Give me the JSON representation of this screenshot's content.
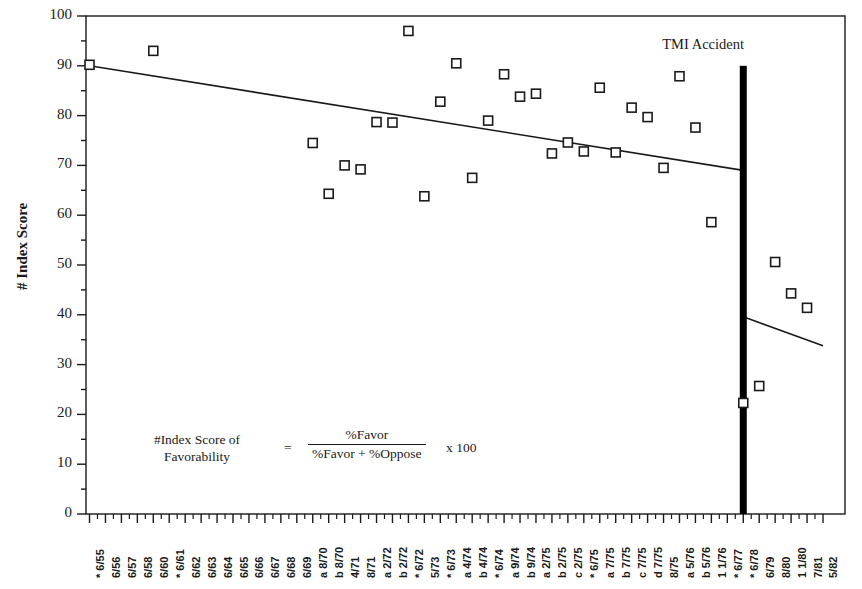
{
  "chart_data": {
    "type": "scatter",
    "title": "",
    "xlabel": "",
    "ylabel": "# Index Score",
    "ylim": [
      0,
      100
    ],
    "ytick_values": [
      0,
      10,
      20,
      30,
      40,
      50,
      60,
      70,
      80,
      90,
      100
    ],
    "ytick_labels": [
      "0",
      "10",
      "20",
      "30",
      "40",
      "50",
      "60",
      "70",
      "80",
      "90",
      "100"
    ],
    "yminor_step": 5,
    "grid": false,
    "legend_position": "none",
    "marker_style": "open-square",
    "categories": [
      "*  6/55",
      "6/56",
      "6/57",
      "6/58",
      "6/60",
      "*  6/61",
      "6/62",
      "6/63",
      "6/64",
      "6/65",
      "6/66",
      "6/67",
      "6/68",
      "6/69",
      "a 8/70",
      "b 8/70",
      "4/71",
      "8/71",
      "a 2/72",
      "b 2/72",
      "*  6/72",
      "5/73",
      "*  6/73",
      "a 4/74",
      "b 4/74",
      "*  6/74",
      "a 9/74",
      "b 9/74",
      "a 2/75",
      "b 2/75",
      "c 2/75",
      "*  6/75",
      "a 7/75",
      "b 7/75",
      "c 7/75",
      "d 7/75",
      "8/75",
      "a 5/76",
      "b 5/76",
      "1 1/76",
      "*  6/77",
      "*  6/78",
      "6/79",
      "8/80",
      "1 1/80",
      "7/81",
      "5/82"
    ],
    "points": [
      {
        "category": "*  6/55",
        "value": 90.2
      },
      {
        "category": "6/60",
        "value": 93.0
      },
      {
        "category": "a 8/70",
        "value": 74.5
      },
      {
        "category": "b 8/70",
        "value": 64.3
      },
      {
        "category": "4/71",
        "value": 70.0
      },
      {
        "category": "8/71",
        "value": 69.2
      },
      {
        "category": "a 2/72",
        "value": 78.7
      },
      {
        "category": "b 2/72",
        "value": 78.6
      },
      {
        "category": "*  6/72",
        "value": 97.0
      },
      {
        "category": "5/73",
        "value": 63.8
      },
      {
        "category": "*  6/73",
        "value": 82.8
      },
      {
        "category": "a 4/74",
        "value": 90.5
      },
      {
        "category": "b 4/74",
        "value": 67.5
      },
      {
        "category": "*  6/74",
        "value": 79.0
      },
      {
        "category": "a 9/74",
        "value": 88.3
      },
      {
        "category": "b 9/74",
        "value": 83.8
      },
      {
        "category": "a 2/75",
        "value": 84.4
      },
      {
        "category": "b 2/75",
        "value": 72.4
      },
      {
        "category": "c 2/75",
        "value": 74.6
      },
      {
        "category": "*  6/75",
        "value": 72.8
      },
      {
        "category": "a 7/75",
        "value": 85.6
      },
      {
        "category": "b 7/75",
        "value": 72.6
      },
      {
        "category": "c 7/75",
        "value": 81.6
      },
      {
        "category": "d 7/75",
        "value": 79.7
      },
      {
        "category": "8/75",
        "value": 69.5
      },
      {
        "category": "a 5/76",
        "value": 87.9
      },
      {
        "category": "b 5/76",
        "value": 77.6
      },
      {
        "category": "1 1/76",
        "value": 58.6
      },
      {
        "category": "*  6/78",
        "value": 22.3
      },
      {
        "category": "6/79",
        "value": 25.7
      },
      {
        "category": "8/80",
        "value": 50.6
      },
      {
        "category": "1 1/80",
        "value": 44.3
      },
      {
        "category": "7/81",
        "value": 41.4
      }
    ],
    "trend_lines": [
      {
        "name": "pre-TMI-trend",
        "x_start_category": "*  6/55",
        "x_end_category": "*  6/78",
        "y_start": 90.0,
        "y_end": 69.0
      },
      {
        "name": "post-TMI-trend",
        "x_start_category": "*  6/78",
        "x_end_category": "5/82",
        "y_start": 39.6,
        "y_end": 33.8
      }
    ],
    "annotations": [
      {
        "name": "tmi-accident-marker",
        "label": "TMI Accident",
        "type": "vertical-bar",
        "at_category": "*  6/78",
        "y_top": 90.0,
        "y_bottom": 0.0,
        "color": "#000000"
      }
    ]
  },
  "axis": {
    "y_title": "# Index Score"
  },
  "formula": {
    "lhs_line1": "#Index Score of",
    "lhs_line2": "Favorability",
    "equals": "=",
    "numerator": "%Favor",
    "denominator": "%Favor + %Oppose",
    "multiplier": "x 100"
  },
  "tmi": {
    "caption": "TMI Accident"
  },
  "colors": {
    "axis": "#1a1a1a",
    "marker_stroke": "#1a1a1a",
    "marker_fill": "#ffffff",
    "trend": "#1a1a1a",
    "tmi_bar": "#000000",
    "background": "#ffffff"
  }
}
